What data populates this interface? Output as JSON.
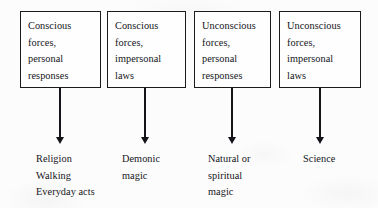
{
  "diagram": {
    "columns": [
      {
        "box_text": "Conscious\nforces,\npersonal\nresponses",
        "outcome_text": "Religion\nWalking\nEveryday acts",
        "arrow": "down-arrow"
      },
      {
        "box_text": "Conscious\nforces,\nimpersonal\nlaws",
        "outcome_text": "Demonic\nmagic",
        "arrow": "down-arrow"
      },
      {
        "box_text": "Unconscious\nforces,\npersonal\nresponses",
        "outcome_text": "Natural or\nspiritual\nmagic",
        "arrow": "down-arrow"
      },
      {
        "box_text": "Unconscious\nforces,\nimpersonal\nlaws",
        "outcome_text": "Science",
        "arrow": "down-arrow"
      }
    ],
    "colors": {
      "ink": "#15151a",
      "border": "#1b1b1b",
      "paper": "#fcfcfc"
    }
  }
}
